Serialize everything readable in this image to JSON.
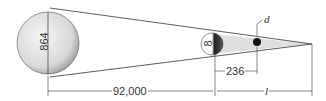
{
  "diagram": {
    "sun_diameter_label": "864",
    "earth_diameter_label": "8",
    "sun_earth_distance_label": "92,000",
    "earth_object_distance_label": "236",
    "object_diameter_label": "d",
    "umbra_length_label": "l",
    "colors": {
      "line": "#333333",
      "shadow": "#d8d8d8",
      "sun_fill": "#e6e6e6",
      "dark": "#111111"
    }
  }
}
